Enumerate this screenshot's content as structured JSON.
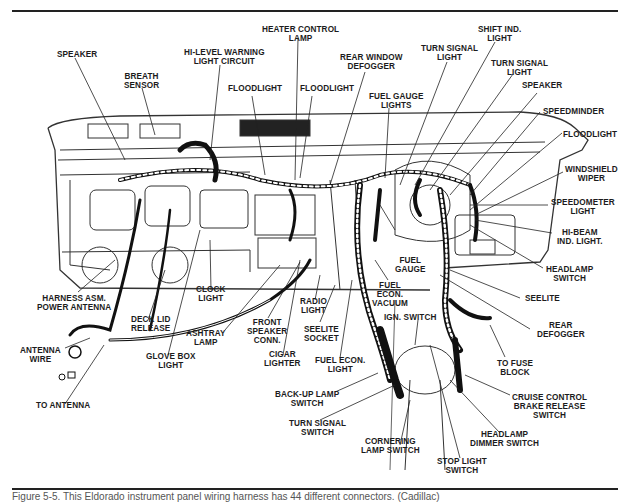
{
  "figure": {
    "caption": "Figure 5-5. This Eldorado instrument panel wiring harness has 44 different connectors. (Cadillac)",
    "subject": "Instrument panel wiring harness"
  },
  "labels": {
    "speaker_left": "SPEAKER",
    "breath_sensor": "BREATH\nSENSOR",
    "hi_level_warning": "HI-LEVEL WARNING\nLIGHT CIRCUIT",
    "heater_control_lamp": "HEATER CONTROL\nLAMP",
    "floodlight_1": "FLOODLIGHT",
    "floodlight_2": "FLOODLIGHT",
    "rear_window_defogger": "REAR WINDOW\nDEFOGGER",
    "fuel_gauge_lights": "FUEL GAUGE\nLIGHTS",
    "turn_signal_light_1": "TURN SIGNAL\nLIGHT",
    "shift_ind_light": "SHIFT IND.\nLIGHT",
    "turn_signal_light_2": "TURN SIGNAL\nLIGHT",
    "speaker_right": "SPEAKER",
    "speedminder": "SPEEDMINDER",
    "floodlight_right": "FLOODLIGHT",
    "windshield_wiper": "WINDSHIELD\nWIPER",
    "speedometer_light": "SPEEDOMETER\nLIGHT",
    "hi_beam_ind_light": "HI-BEAM\nIND. LIGHT.",
    "headlamp_switch": "HEADLAMP\nSWITCH",
    "seelite": "SEELITE",
    "rear_defogger": "REAR\nDEFOGGER",
    "to_fuse_block": "TO FUSE\nBLOCK",
    "cruise_control": "CRUISE CONTROL\nBRAKE RELEASE\nSWITCH",
    "headlamp_dimmer": "HEADLAMP\nDIMMER SWITCH",
    "stop_light_switch": "STOP LIGHT\nSWITCH",
    "cornering_lamp_switch": "CORNERING\nLAMP SWITCH",
    "turn_signal_switch": "TURN SIGNAL\nSWITCH",
    "backup_lamp_switch": "BACK-UP LAMP\nSWITCH",
    "fuel_econ_light": "FUEL ECON.\nLIGHT",
    "ign_switch": "IGN. SWITCH",
    "fuel_econ_vacuum": "FUEL\nECON.\nVACUUM",
    "fuel_gauge": "FUEL\nGAUGE",
    "seelite_socket": "SEELITE\nSOCKET",
    "radio_light": "RADIO\nLIGHT",
    "cigar_lighter": "CIGAR\nLIGHTER",
    "front_speaker_conn": "FRONT\nSPEAKER\nCONN.",
    "ashtray_lamp": "ASHTRAY\nLAMP",
    "clock_light": "CLOCK\nLIGHT",
    "glove_box_light": "GLOVE BOX\nLIGHT",
    "deck_lid_release": "DECK LID\nRELEASE",
    "harness_power_antenna": "HARNESS ASM.\nPOWER ANTENNA",
    "antenna_wire": "ANTENNA\nWIRE",
    "to_antenna": "TO ANTENNA"
  }
}
